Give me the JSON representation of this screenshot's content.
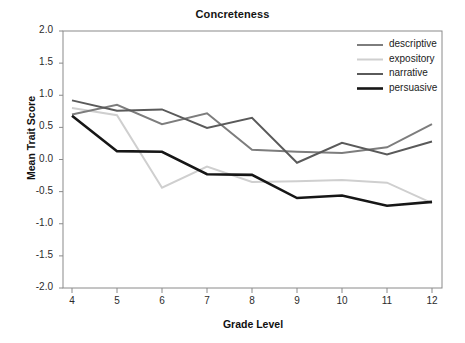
{
  "chart_data": {
    "type": "line",
    "title": "Concreteness",
    "xlabel": "Grade Level",
    "ylabel": "Mean Trait Score",
    "x": [
      4,
      5,
      6,
      7,
      8,
      9,
      10,
      11,
      12
    ],
    "xtick_labels": [
      "4",
      "5",
      "6",
      "7",
      "8",
      "9",
      "10",
      "11",
      "12"
    ],
    "ytick_labels": [
      "2.0",
      "1.5",
      "1.0",
      "0.5",
      "0.0",
      "-0.5",
      "-1.0",
      "-1.5",
      "-2.0"
    ],
    "ytick_values": [
      2.0,
      1.5,
      1.0,
      0.5,
      0.0,
      -0.5,
      -1.0,
      -1.5,
      -2.0
    ],
    "xlim": [
      4,
      12
    ],
    "ylim": [
      -2.0,
      2.0
    ],
    "grid": false,
    "legend_position": "top-right",
    "series": [
      {
        "name": "descriptive",
        "color": "#7d7d7d",
        "width": 2.0,
        "values": [
          0.7,
          0.85,
          0.55,
          0.72,
          0.15,
          0.12,
          0.1,
          0.19,
          0.55
        ]
      },
      {
        "name": "expository",
        "color": "#cfcfcf",
        "width": 2.0,
        "values": [
          0.8,
          0.69,
          -0.44,
          -0.11,
          -0.35,
          -0.34,
          -0.32,
          -0.36,
          -0.68
        ]
      },
      {
        "name": "narrative",
        "color": "#5a5a5a",
        "width": 2.0,
        "values": [
          0.92,
          0.76,
          0.78,
          0.49,
          0.65,
          -0.05,
          0.26,
          0.08,
          0.28
        ]
      },
      {
        "name": "persuasive",
        "color": "#161616",
        "width": 2.6,
        "values": [
          0.68,
          0.13,
          0.12,
          -0.23,
          -0.24,
          -0.6,
          -0.56,
          -0.72,
          -0.66
        ]
      }
    ]
  },
  "legend": {
    "entries": [
      {
        "label": "descriptive"
      },
      {
        "label": "expository"
      },
      {
        "label": "narrative"
      },
      {
        "label": "persuasive"
      }
    ]
  },
  "axes": {
    "frame_color": "#8a8a8a"
  }
}
